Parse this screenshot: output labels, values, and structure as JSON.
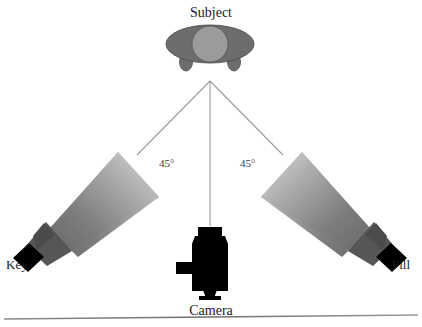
{
  "diagram": {
    "title_label": "Subject",
    "camera_label": "Camera",
    "key_light_label": "Key",
    "fill_light_label": "Fill",
    "angle_left_label": "45°",
    "angle_right_label": "45°",
    "colors": {
      "background": "#ffffff",
      "subject_body": "#6e6e6e",
      "subject_head": "#9a9a9a",
      "subject_outline": "#4a4a4a",
      "beam_near": "#6b6b6b",
      "beam_far": "#d8d8d8",
      "housing": "#5a5a5a",
      "housing_dark": "#4a4a4a",
      "lamp_body": "#000000",
      "camera_body": "#000000",
      "guide_line": "#9b9b9b",
      "ground_line": "#8c8c8c",
      "text": "#1a1a1a"
    },
    "geometry": {
      "apex_x": 210,
      "apex_y": 80,
      "ground_line_y": 318,
      "canvas_width": 422,
      "canvas_height": 327
    }
  }
}
